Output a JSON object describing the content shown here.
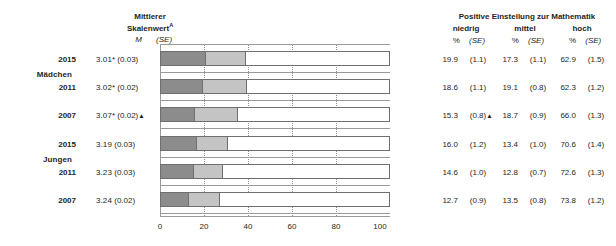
{
  "mean_header": {
    "line1": "Mittlerer",
    "line2": "Skalenwert",
    "line2_sup": "A",
    "m_label": "M",
    "se_label": "(SE)"
  },
  "right_header": {
    "title": "Positive Einstellung zur Mathematik",
    "categories": [
      "niedrig",
      "mittel",
      "hoch"
    ],
    "pct_label": "%",
    "se_label": "(SE)"
  },
  "groups": [
    {
      "name": "Mädchen",
      "rows": [
        {
          "year": "2015",
          "mean": "3.01",
          "mean_star": "*",
          "mean_se": "(0.03)",
          "mean_triangle": "",
          "niedrig_pct": "19.9",
          "niedrig_se": "(1.1)",
          "niedrig_triangle": "",
          "mittel_pct": "17.3",
          "mittel_se": "(1.1)",
          "hoch_pct": "62.9",
          "hoch_se": "(1.5)",
          "values": [
            19.9,
            17.3,
            62.9
          ]
        },
        {
          "year": "2011",
          "mean": "3.02",
          "mean_star": "*",
          "mean_se": "(0.02)",
          "mean_triangle": "",
          "niedrig_pct": "18.6",
          "niedrig_se": "(1.1)",
          "niedrig_triangle": "",
          "mittel_pct": "19.1",
          "mittel_se": "(0.8)",
          "hoch_pct": "62.3",
          "hoch_se": "(1.2)",
          "values": [
            18.6,
            19.1,
            62.3
          ]
        },
        {
          "year": "2007",
          "mean": "3.07",
          "mean_star": "*",
          "mean_se": "(0.02)",
          "mean_triangle": "▲",
          "niedrig_pct": "15.3",
          "niedrig_se": "(0.8)",
          "niedrig_triangle": "▲",
          "mittel_pct": "18.7",
          "mittel_se": "(0.9)",
          "hoch_pct": "66.0",
          "hoch_se": "(1.3)",
          "values": [
            15.3,
            18.7,
            66.0
          ]
        }
      ]
    },
    {
      "name": "Jungen",
      "rows": [
        {
          "year": "2015",
          "mean": "3.19",
          "mean_star": "",
          "mean_se": "(0.03)",
          "mean_triangle": "",
          "niedrig_pct": "16.0",
          "niedrig_se": "(1.2)",
          "niedrig_triangle": "",
          "mittel_pct": "13.4",
          "mittel_se": "(1.0)",
          "hoch_pct": "70.6",
          "hoch_se": "(1.4)",
          "values": [
            16.0,
            13.4,
            70.6
          ]
        },
        {
          "year": "2011",
          "mean": "3.23",
          "mean_star": "",
          "mean_se": "(0.03)",
          "mean_triangle": "",
          "niedrig_pct": "14.6",
          "niedrig_se": "(1.0)",
          "niedrig_triangle": "",
          "mittel_pct": "12.8",
          "mittel_se": "(0.7)",
          "hoch_pct": "72.6",
          "hoch_se": "(1.3)",
          "values": [
            14.6,
            12.8,
            72.6
          ]
        },
        {
          "year": "2007",
          "mean": "3.24",
          "mean_star": "",
          "mean_se": "(0.02)",
          "mean_triangle": "",
          "niedrig_pct": "12.7",
          "niedrig_se": "(0.9)",
          "niedrig_triangle": "",
          "mittel_pct": "13.5",
          "mittel_se": "(0.8)",
          "hoch_pct": "73.8",
          "hoch_se": "(1.2)",
          "values": [
            12.7,
            13.5,
            73.8
          ]
        }
      ]
    }
  ],
  "axis": {
    "ticks": [
      "0",
      "20",
      "40",
      "60",
      "80",
      "100"
    ],
    "min": 0,
    "max": 100
  },
  "colors": {
    "niedrig": "#8c8c8c",
    "mittel": "#c4c4c4",
    "hoch": "#ffffff",
    "outline": "#6f6f6f",
    "axis": "#9a9a9a",
    "text": "#231f20"
  },
  "chart_data": {
    "type": "bar",
    "title": "Positive Einstellung zur Mathematik",
    "subtitle": "",
    "xlabel": "",
    "ylabel": "",
    "stacked": true,
    "orientation": "horizontal",
    "xlim": [
      0,
      100
    ],
    "grid": "dotted vertical gridlines at 20, 40, 60, 80",
    "legend": "none (column headers niedrig / mittel / hoch)",
    "categories": [
      "Mädchen 2015",
      "Mädchen 2011",
      "Mädchen 2007",
      "Jungen 2015",
      "Jungen 2011",
      "Jungen 2007"
    ],
    "series": [
      {
        "name": "niedrig",
        "values": [
          19.9,
          18.6,
          15.3,
          16.0,
          14.6,
          12.7
        ],
        "se": [
          1.1,
          1.1,
          0.8,
          1.2,
          1.0,
          0.9
        ],
        "color": "#8c8c8c"
      },
      {
        "name": "mittel",
        "values": [
          17.3,
          19.1,
          18.7,
          13.4,
          12.8,
          13.5
        ],
        "se": [
          1.1,
          0.8,
          0.9,
          1.0,
          0.7,
          0.8
        ],
        "color": "#c4c4c4"
      },
      {
        "name": "hoch",
        "values": [
          62.9,
          62.3,
          66.0,
          70.6,
          72.6,
          73.8
        ],
        "se": [
          1.5,
          1.2,
          1.3,
          1.4,
          1.3,
          1.2
        ],
        "color": "#ffffff"
      }
    ],
    "mean_scale_values": {
      "label": "Mittlerer Skalenwert",
      "M": [
        3.01,
        3.02,
        3.07,
        3.19,
        3.23,
        3.24
      ],
      "SE": [
        0.03,
        0.02,
        0.02,
        0.03,
        0.03,
        0.02
      ],
      "significance_star": [
        true,
        true,
        true,
        false,
        false,
        false
      ],
      "triangle_marker": [
        false,
        false,
        true,
        false,
        false,
        false
      ]
    },
    "xticks": [
      0,
      20,
      40,
      60,
      80,
      100
    ]
  }
}
